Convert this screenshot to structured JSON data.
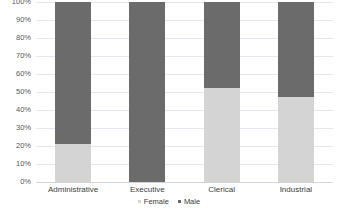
{
  "chart_data": {
    "type": "bar",
    "subtype": "100% stacked column",
    "title": "",
    "xlabel": "",
    "ylabel": "",
    "categories": [
      "Administrative",
      "Executive",
      "Clerical",
      "Industrial"
    ],
    "series": [
      {
        "name": "Female",
        "color": "#d4d4d4",
        "values": [
          21,
          0,
          52,
          47
        ]
      },
      {
        "name": "Male",
        "color": "#6b6b6b",
        "values": [
          79,
          100,
          48,
          53
        ]
      }
    ],
    "ylim": [
      0,
      100
    ],
    "ytick_labels": [
      "0%",
      "10%",
      "20%",
      "30%",
      "40%",
      "50%",
      "60%",
      "70%",
      "80%",
      "90%",
      "100%"
    ],
    "ytick_values": [
      0,
      10,
      20,
      30,
      40,
      50,
      60,
      70,
      80,
      90,
      100
    ],
    "grid": true,
    "legend_position": "bottom-center",
    "value_unit": "%"
  },
  "legend": {
    "items": [
      {
        "label": "Female",
        "color": "#d4d4d4"
      },
      {
        "label": "Male",
        "color": "#6b6b6b"
      }
    ]
  },
  "colors": {
    "female": "#d4d4d4",
    "male": "#6b6b6b",
    "gridline": "#e4e9ef",
    "baseline": "#d0d5db",
    "background": "#ffffff",
    "tick_text": "#585858",
    "category_text": "#3d3d3d"
  }
}
